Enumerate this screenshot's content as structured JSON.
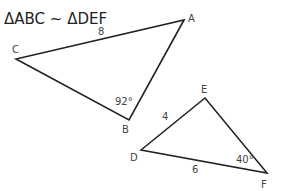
{
  "title": "ΔABC ~ ΔDEF",
  "triangles": [
    {
      "name": "ABC",
      "vertices": {
        "A": {
          "label": "A",
          "x": 184,
          "y": 20
        },
        "B": {
          "label": "B",
          "x": 129,
          "y": 120
        },
        "C": {
          "label": "C",
          "x": 16,
          "y": 59
        }
      },
      "side_labels": [
        {
          "side": "CA",
          "text": "8"
        }
      ],
      "angle_labels": [
        {
          "vertex": "B",
          "text": "92°"
        }
      ]
    },
    {
      "name": "DEF",
      "vertices": {
        "D": {
          "label": "D",
          "x": 141,
          "y": 150
        },
        "E": {
          "label": "E",
          "x": 205,
          "y": 98
        },
        "F": {
          "label": "F",
          "x": 267,
          "y": 173
        }
      },
      "side_labels": [
        {
          "side": "DE",
          "text": "4"
        },
        {
          "side": "DF",
          "text": "6"
        }
      ],
      "angle_labels": [
        {
          "vertex": "F",
          "text": "40°"
        }
      ]
    }
  ],
  "colors": {
    "stroke": "#222222",
    "text": "#444444",
    "background": "#ffffff"
  }
}
